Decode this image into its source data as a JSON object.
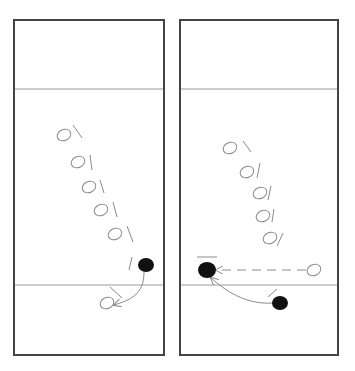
{
  "colors": {
    "background": "#ffffff",
    "border": "#444444",
    "court_line": "#9a9a9a",
    "player_open": "#8a8a8a",
    "player_filled": "#111111",
    "movement": "#8c8c8c"
  },
  "panels": [
    {
      "id": "left",
      "rect": {
        "x": 14,
        "y": 20,
        "w": 150,
        "h": 335
      },
      "lines_y": [
        89,
        285
      ],
      "open_players": [
        {
          "cx": 64,
          "cy": 135,
          "slash": [
            73,
            125,
            82,
            138
          ]
        },
        {
          "cx": 78,
          "cy": 162,
          "slash": [
            90,
            155,
            92,
            170
          ]
        },
        {
          "cx": 89,
          "cy": 187,
          "slash": [
            100,
            180,
            104,
            193
          ]
        },
        {
          "cx": 101,
          "cy": 210,
          "slash": [
            113,
            202,
            117,
            217
          ]
        },
        {
          "cx": 115,
          "cy": 234,
          "slash": [
            127,
            226,
            133,
            242
          ]
        },
        {
          "cx": 107,
          "cy": 303,
          "slash": [
            110,
            287,
            122,
            298
          ]
        }
      ],
      "slashes_extra": [
        [
          132,
          257,
          129,
          270
        ]
      ],
      "filled_players": [
        {
          "cx": 146,
          "cy": 265,
          "r": 7
        }
      ],
      "arrows": [
        {
          "type": "curve",
          "d": "M144 272 C144 295 130 300 114 305",
          "dashed": false
        }
      ]
    },
    {
      "id": "right",
      "rect": {
        "x": 180,
        "y": 20,
        "w": 158,
        "h": 335
      },
      "lines_y": [
        89,
        285
      ],
      "open_players": [
        {
          "cx": 230,
          "cy": 148,
          "slash": [
            243,
            141,
            251,
            152
          ]
        },
        {
          "cx": 247,
          "cy": 172,
          "slash": [
            260,
            163,
            257,
            178
          ]
        },
        {
          "cx": 260,
          "cy": 193,
          "slash": [
            271,
            186,
            268,
            200
          ]
        },
        {
          "cx": 263,
          "cy": 216,
          "slash": [
            274,
            209,
            272,
            222
          ]
        },
        {
          "cx": 270,
          "cy": 238,
          "slash": [
            283,
            233,
            277,
            246
          ]
        },
        {
          "cx": 314,
          "cy": 270,
          "slash": null
        }
      ],
      "slashes_extra": [
        [
          197,
          257,
          217,
          257
        ],
        [
          268,
          297,
          277,
          289
        ]
      ],
      "filled_players": [
        {
          "cx": 207,
          "cy": 270,
          "r": 8
        },
        {
          "cx": 280,
          "cy": 303,
          "r": 7
        }
      ],
      "arrows": [
        {
          "type": "line",
          "d": "M306 270 L216 270",
          "dashed": true
        },
        {
          "type": "curve",
          "d": "M273 303 C245 305 225 290 211 278",
          "dashed": false
        }
      ]
    }
  ]
}
